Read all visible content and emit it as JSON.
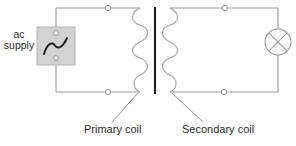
{
  "diagram": {
    "labels": {
      "ac_supply": "ac\nsupply",
      "ac_supply_line1": "ac",
      "ac_supply_line2": "supply",
      "primary_coil": "Primary coil",
      "secondary_coil": "Secondary coil"
    },
    "components": {
      "ac_supply_source": {
        "name": "ac supply",
        "symbol": "sine-wave",
        "box_fill": "#d2d2d2",
        "box_stroke": "#b3b3b3"
      },
      "primary_coil": {
        "name": "Primary coil",
        "symbol": "coil-winding",
        "turns": 5
      },
      "transformer_core": {
        "name": "iron core",
        "symbol": "solid-bar",
        "color": "#1d1d1d"
      },
      "secondary_coil": {
        "name": "Secondary coil",
        "symbol": "coil-winding",
        "turns": 5
      },
      "lamp": {
        "name": "lamp",
        "symbol": "circle-with-cross",
        "color": "#9a9a9a"
      }
    },
    "terminals": [
      {
        "name": "primary-top-terminal",
        "x": 108,
        "y": 8
      },
      {
        "name": "primary-bottom-terminal",
        "x": 108,
        "y": 92
      },
      {
        "name": "secondary-top-terminal",
        "x": 225,
        "y": 9
      },
      {
        "name": "secondary-bottom-terminal",
        "x": 224,
        "y": 92
      },
      {
        "name": "supply-top-terminal",
        "x": 56,
        "y": 33
      },
      {
        "name": "supply-bottom-terminal",
        "x": 56,
        "y": 58
      }
    ],
    "colors": {
      "wire": "#9a9a9a",
      "coil": "#a5a5a5",
      "core": "#1d1d1d",
      "text": "#2b2b2b",
      "background": "#ffffff"
    }
  }
}
